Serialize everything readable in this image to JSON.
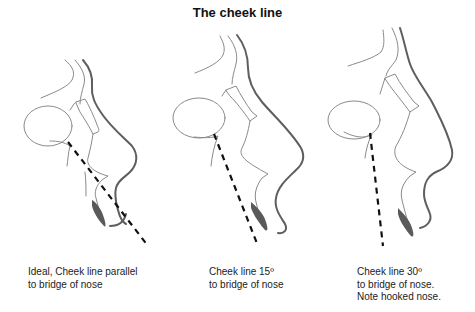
{
  "title": "The cheek line",
  "panels": [
    {
      "id": "ideal",
      "caption_lines": [
        "Ideal, Cheek line parallel",
        "to bridge of nose"
      ],
      "cheek_line_angle_deg": 0
    },
    {
      "id": "fifteen",
      "caption_lines": [
        "Cheek line 15º",
        "to bridge of nose"
      ],
      "cheek_line_angle_deg": 15
    },
    {
      "id": "thirty",
      "caption_lines": [
        "Cheek line 30º",
        "to bridge of nose.",
        "Note hooked nose."
      ],
      "cheek_line_angle_deg": 30
    }
  ],
  "colors": {
    "outline_thin": "#8a8a8a",
    "outline_thick": "#5e5e5e",
    "cheek_line": "#111111",
    "lip_fill": "#5a5a5a"
  }
}
